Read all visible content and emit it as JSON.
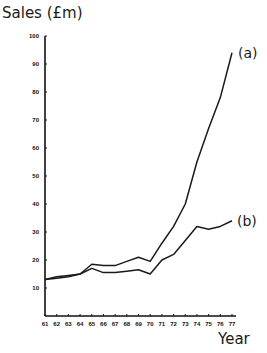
{
  "chart_data": {
    "type": "line",
    "title": "",
    "ylabel": "Sales (£m)",
    "xlabel": "Year",
    "x": [
      "61",
      "62",
      "63",
      "64",
      "65",
      "66",
      "67",
      "68",
      "69",
      "70",
      "71",
      "72",
      "73",
      "74",
      "75",
      "76",
      "77"
    ],
    "yticks": [
      10,
      20,
      30,
      40,
      50,
      60,
      70,
      80,
      90,
      100
    ],
    "ylim": [
      0,
      100
    ],
    "grid": false,
    "legend": "inline labels at line ends",
    "series": [
      {
        "name": "(a)",
        "values": [
          13,
          13.5,
          14,
          15,
          18.5,
          18,
          18,
          19.5,
          21,
          19.5,
          26,
          32,
          40,
          55,
          67,
          78,
          94
        ]
      },
      {
        "name": "(b)",
        "values": [
          13,
          14,
          14.5,
          15,
          17,
          15.5,
          15.5,
          16,
          16.5,
          15,
          20,
          22,
          27,
          32,
          31,
          32,
          34
        ]
      }
    ]
  },
  "labels": {
    "y_axis_title": "Sales (£m)",
    "x_axis_title": "Year",
    "series_a": "(a)",
    "series_b": "(b)"
  }
}
